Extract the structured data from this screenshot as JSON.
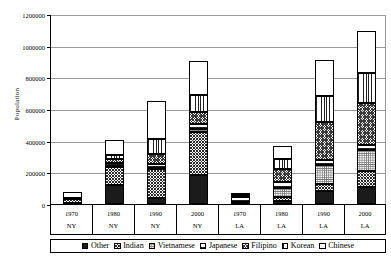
{
  "chart_data": {
    "type": "bar",
    "subtype": "stacked-bar",
    "title": "",
    "xlabel": "",
    "ylabel": "Population",
    "ylim": [
      0,
      1200000
    ],
    "ytick_values": [
      0,
      200000,
      400000,
      600000,
      800000,
      1000000,
      1200000
    ],
    "ytick_labels": [
      "0",
      "200000",
      "400000",
      "600000",
      "800000",
      "1000000",
      "1200000"
    ],
    "grid": true,
    "legend_position": "bottom",
    "categories": [
      "1970",
      "1980",
      "1990",
      "2000",
      "1970",
      "1980",
      "1990",
      "2000"
    ],
    "category_groups": [
      "NY",
      "NY",
      "NY",
      "NY",
      "LA",
      "LA",
      "LA",
      "LA"
    ],
    "series": [
      {
        "name": "Other",
        "pattern": "solid-black",
        "values": [
          5000,
          120000,
          40000,
          185000,
          5000,
          18000,
          85000,
          105000
        ]
      },
      {
        "name": "Indian",
        "pattern": "dense-checker",
        "values": [
          25000,
          115000,
          180000,
          270000,
          5000,
          28000,
          40000,
          105000
        ]
      },
      {
        "name": "Vietnamese",
        "pattern": "fine-dots",
        "values": [
          0,
          5000,
          10000,
          20000,
          5000,
          55000,
          120000,
          130000
        ]
      },
      {
        "name": "Japanese",
        "pattern": "horizontal-lines",
        "values": [
          5000,
          20000,
          25000,
          30000,
          30000,
          40000,
          30000,
          30000
        ]
      },
      {
        "name": "Filipino",
        "pattern": "cross-hatch",
        "values": [
          5000,
          25000,
          60000,
          75000,
          10000,
          80000,
          245000,
          265000
        ]
      },
      {
        "name": "Korean",
        "pattern": "vertical-lines",
        "values": [
          0,
          25000,
          95000,
          110000,
          5000,
          65000,
          160000,
          190000
        ]
      },
      {
        "name": "Chinese",
        "pattern": "white",
        "values": [
          35000,
          95000,
          240000,
          215000,
          10000,
          80000,
          230000,
          270000
        ]
      }
    ],
    "totals": [
      75000,
      405000,
      650000,
      905000,
      70000,
      366000,
      910000,
      1095000
    ]
  },
  "axis": {
    "y_title": "Population",
    "y_ticks": [
      "1200000",
      "1000000",
      "800000",
      "600000",
      "400000",
      "200000",
      "0"
    ]
  },
  "legend": {
    "items": [
      {
        "label": "Other",
        "icon": "legend-swatch-solid-black"
      },
      {
        "label": "Indian",
        "icon": "legend-swatch-dense-checker"
      },
      {
        "label": "Vietnamese",
        "icon": "legend-swatch-fine-dots"
      },
      {
        "label": "Japanese",
        "icon": "legend-swatch-horizontal-lines"
      },
      {
        "label": "Filipino",
        "icon": "legend-swatch-cross-hatch"
      },
      {
        "label": "Korean",
        "icon": "legend-swatch-vertical-lines"
      },
      {
        "label": "Chinese",
        "icon": "legend-swatch-white"
      }
    ]
  },
  "xaxis": {
    "cells": [
      {
        "year": "1970",
        "city": "NY"
      },
      {
        "year": "1980",
        "city": "NY"
      },
      {
        "year": "1990",
        "city": "NY"
      },
      {
        "year": "2000",
        "city": "NY"
      },
      {
        "year": "1970",
        "city": "LA"
      },
      {
        "year": "1980",
        "city": "LA"
      },
      {
        "year": "1990",
        "city": "LA"
      },
      {
        "year": "2000",
        "city": "LA"
      }
    ]
  },
  "colors": {
    "axis": "#000000",
    "grid": "#9a9a9a",
    "background": "#ffffff",
    "series_dark": "#1b1b1b"
  }
}
